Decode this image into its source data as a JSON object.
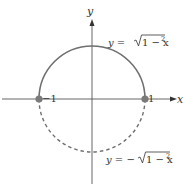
{
  "diagram": {
    "axes": {
      "x_label": "x",
      "y_label": "y"
    },
    "points": [
      {
        "label": "−1",
        "x": -1,
        "y": 0
      },
      {
        "label": "1",
        "x": 1,
        "y": 0
      }
    ],
    "curves": [
      {
        "name": "upper-semicircle",
        "style": "solid",
        "equation": {
          "lhs": "y = ",
          "sign": "",
          "radicand": "1 − x",
          "exp": "2"
        }
      },
      {
        "name": "lower-semicircle",
        "style": "dashed",
        "equation": {
          "lhs": "y = ",
          "sign": "−",
          "radicand": "1 − x",
          "exp": "2"
        }
      }
    ],
    "colors": {
      "curve": "#6f6f6f",
      "axis": "#555555",
      "point": "#7a7a7a",
      "text": "#333333"
    }
  }
}
